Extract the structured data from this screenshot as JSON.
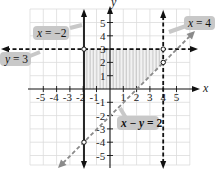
{
  "figure": {
    "type": "graph-of-system-of-inequalities",
    "axes": {
      "x_label": "x",
      "y_label": "y",
      "x_ticks": [
        "-5",
        "-4",
        "-3",
        "-2",
        "-1",
        "1",
        "2",
        "3",
        "4",
        "5"
      ],
      "y_ticks": [
        "5",
        "4",
        "3",
        "2",
        "1",
        "-1",
        "-2",
        "-3",
        "-4",
        "-5"
      ],
      "range": {
        "x": [
          -6,
          6
        ],
        "y": [
          -6,
          6
        ]
      },
      "grid": true
    },
    "lines": [
      {
        "id": "x_eq_neg2",
        "label": "x = −2",
        "label_var": "x",
        "label_rest": " = −2",
        "style": "solid",
        "color": "#111111"
      },
      {
        "id": "y_eq_3",
        "label": "y = 3",
        "label_var": "y",
        "label_rest": " = 3",
        "style": "dashed",
        "color": "#111111"
      },
      {
        "id": "x_eq_4",
        "label": "x = 4",
        "label_var": "x",
        "label_rest": " = 4",
        "style": "dashed",
        "color": "#111111"
      },
      {
        "id": "x_minus_y_eq_2",
        "label": "x − y = 2",
        "style": "dashed",
        "color": "#808080"
      }
    ],
    "intersection_points": [
      {
        "x": -2,
        "y": 3
      },
      {
        "x": 4,
        "y": 3
      },
      {
        "x": 4,
        "y": 2
      },
      {
        "x": -2,
        "y": -4
      }
    ],
    "colors": {
      "grid": "#d9d9d9",
      "shade": "#cfcfcf",
      "callout_bg": "#c8c8c8",
      "axis": "#111111",
      "diagonal": "#808080"
    }
  }
}
